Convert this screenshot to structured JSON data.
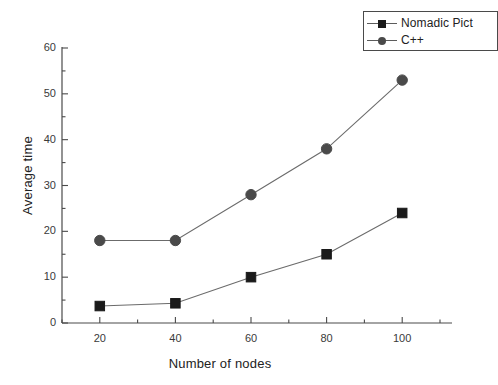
{
  "chart_data": {
    "type": "line",
    "title": "",
    "xlabel": "Number of nodes",
    "ylabel": "Average time",
    "x": [
      20,
      40,
      60,
      80,
      100
    ],
    "xlim": [
      10,
      110
    ],
    "ylim": [
      0,
      60
    ],
    "xticks": [
      "20",
      "40",
      "60",
      "80",
      "100"
    ],
    "yticks": [
      "0",
      "10",
      "20",
      "30",
      "40",
      "50",
      "60"
    ],
    "grid": false,
    "legend_position": "top-right",
    "series": [
      {
        "name": "Nomadic Pict",
        "marker": "square",
        "color": "#1a1a1a",
        "values": [
          3.7,
          4.3,
          10,
          15,
          24
        ]
      },
      {
        "name": "C++",
        "marker": "circle",
        "color": "#4a4a4a",
        "values": [
          18,
          18,
          28,
          38,
          53
        ]
      }
    ]
  },
  "legend": {
    "entries": [
      {
        "label": "Nomadic Pict"
      },
      {
        "label": "C++"
      }
    ]
  },
  "axes": {
    "x_title": "Number of nodes",
    "y_title": "Average time",
    "x_tick_labels": [
      "20",
      "40",
      "60",
      "80",
      "100"
    ],
    "y_tick_labels": [
      "0",
      "10",
      "20",
      "30",
      "40",
      "50",
      "60"
    ]
  },
  "colors": {
    "background": "#ffffff",
    "axis": "#4a4a4a",
    "series_nomadic": "#1a1a1a",
    "series_cpp": "#4a4a4a"
  }
}
